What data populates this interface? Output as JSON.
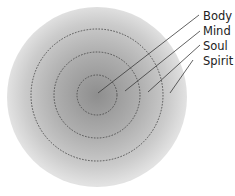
{
  "diagram": {
    "title": "",
    "layers": [
      {
        "id": "body",
        "label": "Body"
      },
      {
        "id": "mind",
        "label": "Mind"
      },
      {
        "id": "soul",
        "label": "Soul"
      },
      {
        "id": "spirit",
        "label": "Spirit"
      }
    ],
    "colors": {
      "center_fill": "#8f8f8f",
      "outer_fill": "#d9d9d9",
      "dashed_stroke": "#4a4a4a",
      "leader_stroke": "#3a3a3a",
      "label_text": "#222222"
    }
  }
}
